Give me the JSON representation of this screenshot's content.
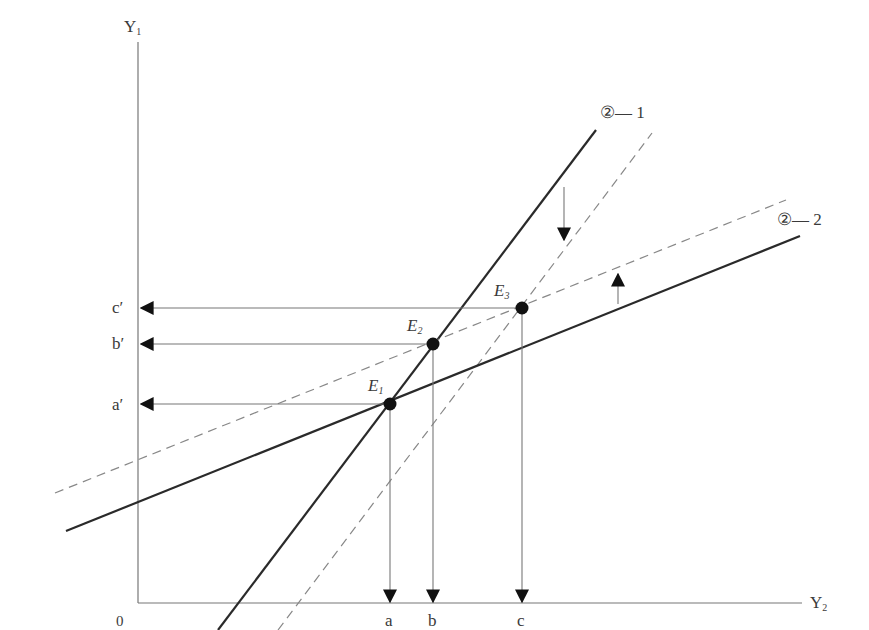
{
  "diagram": {
    "axes": {
      "y_label": "Y",
      "y_sub": "1",
      "x_label": "Y",
      "x_sub": "2",
      "origin": "0"
    },
    "lines": [
      {
        "id": "line-2-1",
        "label": "②— 1",
        "style": "solid",
        "from": [
          218,
          630
        ],
        "to": [
          596,
          130
        ]
      },
      {
        "id": "line-2-1-shifted",
        "label": "",
        "style": "dashed",
        "from": [
          278,
          630
        ],
        "to": [
          652,
          133
        ]
      },
      {
        "id": "line-2-2",
        "label": "②— 2",
        "style": "solid",
        "from": [
          66,
          531
        ],
        "to": [
          800,
          236
        ]
      },
      {
        "id": "line-2-2-shifted",
        "label": "",
        "style": "dashed",
        "from": [
          55,
          493
        ],
        "to": [
          786,
          200
        ]
      }
    ],
    "equilibria": [
      {
        "name": "E",
        "sub": "1",
        "x": 390,
        "y": 404,
        "x_tick": "a",
        "y_tick": "a′"
      },
      {
        "name": "E",
        "sub": "2",
        "x": 433,
        "y": 344,
        "x_tick": "b",
        "y_tick": "b′"
      },
      {
        "name": "E",
        "sub": "3",
        "x": 522,
        "y": 308,
        "x_tick": "c",
        "y_tick": "c′"
      }
    ],
    "shift_arrows": [
      {
        "direction": "down",
        "x": 564,
        "y1": 187,
        "y2": 240
      },
      {
        "direction": "up",
        "x": 618,
        "y1": 304,
        "y2": 274
      }
    ],
    "colors": {
      "solid_line": "#2a2a2a",
      "dashed_line": "#888888",
      "axis": "#777777",
      "projection": "#777777",
      "point": "#111111"
    }
  }
}
